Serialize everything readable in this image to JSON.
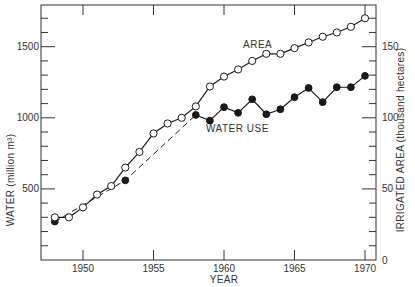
{
  "chart_data": {
    "type": "line",
    "title": "",
    "xlabel": "YEAR",
    "ylabel_left": "WATER (million m³)",
    "ylabel_right": "IRRIGATED AREA (thousand hectares)",
    "xlim": [
      1947.5,
      1970.7
    ],
    "ylim_left": [
      0,
      1750
    ],
    "ylim_right": [
      0,
      175
    ],
    "x_ticks": [
      1950,
      1955,
      1960,
      1965,
      1970
    ],
    "y_ticks_left": [
      500,
      1000,
      1500
    ],
    "y_ticks_right": [
      0,
      50,
      100,
      150
    ],
    "grid": false,
    "legend": "inline labels",
    "series": [
      {
        "name": "AREA",
        "axis": "right",
        "marker": "open-circle",
        "line": "solid",
        "x": [
          1948,
          1949,
          1950,
          1951,
          1952,
          1953,
          1954,
          1955,
          1956,
          1957,
          1958,
          1959,
          1960,
          1961,
          1962,
          1963,
          1964,
          1965,
          1966,
          1967,
          1968,
          1969,
          1970
        ],
        "values": [
          30,
          30,
          37,
          46,
          52,
          65,
          76,
          89,
          96,
          100,
          108,
          122,
          129,
          134,
          140,
          145,
          145,
          149,
          153,
          157,
          160,
          164,
          170
        ]
      },
      {
        "name": "WATER USE",
        "axis": "left",
        "marker": "filled-circle",
        "line": "solid (dashed 1948–1958)",
        "x": [
          1948,
          1953,
          1958,
          1959,
          1960,
          1961,
          1962,
          1963,
          1964,
          1965,
          1966,
          1967,
          1968,
          1969,
          1970
        ],
        "values": [
          270,
          560,
          1020,
          980,
          1075,
          1035,
          1130,
          1025,
          1060,
          1145,
          1210,
          1110,
          1215,
          1215,
          1295
        ]
      }
    ],
    "annotations": [
      "AREA",
      "WATER USE"
    ]
  },
  "labels": {
    "xlabel": "YEAR",
    "ylabel_left": "WATER (million m³)",
    "ylabel_right": "IRRIGATED  AREA (thousand hectares)",
    "area": "AREA",
    "water_use": "WATER USE"
  },
  "colors": {
    "ink": "#1a1a1a",
    "axis": "#333333",
    "background": "#ffffff"
  }
}
